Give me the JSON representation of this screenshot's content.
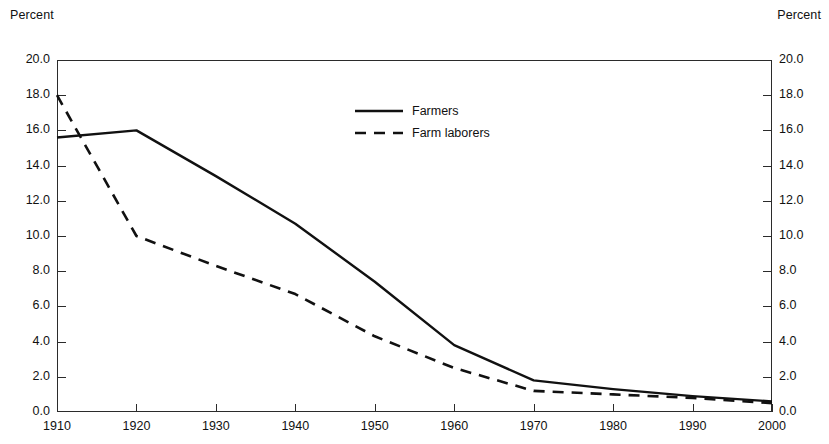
{
  "axis_titles": {
    "left": "Percent",
    "right": "Percent"
  },
  "legend": {
    "items": [
      {
        "label": "Farmers",
        "style": "solid",
        "color": "#111111"
      },
      {
        "label": "Farm laborers",
        "style": "dashed",
        "color": "#111111"
      }
    ]
  },
  "chart_data": {
    "type": "line",
    "title": "",
    "xlabel": "",
    "ylabel": "Percent",
    "ylabel_right": "Percent",
    "xlim": [
      1910,
      2000
    ],
    "ylim": [
      0.0,
      20.0
    ],
    "ytick_step": 2.0,
    "xtick_step": 10,
    "grid": false,
    "legend_position": "upper-center",
    "xticks": [
      1910,
      1920,
      1930,
      1940,
      1950,
      1960,
      1970,
      1980,
      1990,
      2000
    ],
    "xtick_labels": [
      "1910",
      "1920",
      "1930",
      "1940",
      "1950",
      "1960",
      "1970",
      "1980",
      "1990",
      "2000"
    ],
    "yticks": [
      0.0,
      2.0,
      4.0,
      6.0,
      8.0,
      10.0,
      12.0,
      14.0,
      16.0,
      18.0,
      20.0
    ],
    "ytick_labels": [
      "0.0",
      "2.0",
      "4.0",
      "6.0",
      "8.0",
      "10.0",
      "12.0",
      "14.0",
      "16.0",
      "18.0",
      "20.0"
    ],
    "x": [
      1910,
      1920,
      1930,
      1940,
      1950,
      1960,
      1970,
      1980,
      1990,
      2000
    ],
    "series": [
      {
        "name": "Farmers",
        "style": "solid",
        "color": "#111111",
        "values": [
          15.6,
          16.0,
          13.4,
          10.7,
          7.4,
          3.8,
          1.8,
          1.3,
          0.9,
          0.6
        ]
      },
      {
        "name": "Farm laborers",
        "style": "dashed",
        "color": "#111111",
        "values": [
          18.0,
          10.0,
          8.3,
          6.7,
          4.3,
          2.5,
          1.2,
          1.0,
          0.8,
          0.5
        ]
      }
    ]
  }
}
